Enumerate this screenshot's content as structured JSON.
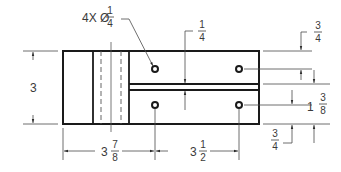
{
  "drawing": {
    "type": "orthographic-view",
    "line_color": "#1a1a1a",
    "dim_color": "#4a4a4a",
    "hole_callout": {
      "prefix": "4X Ø",
      "num": "1",
      "den": "4"
    },
    "dims": {
      "height": {
        "value": "3"
      },
      "slot_top": {
        "num": "1",
        "den": "4"
      },
      "top_offset": {
        "num": "3",
        "den": "4"
      },
      "hole_spacing_v": {
        "whole": "1",
        "num": "3",
        "den": "8"
      },
      "bottom_offset": {
        "num": "3",
        "den": "4"
      },
      "left_to_hole": {
        "whole": "3",
        "num": "7",
        "den": "8"
      },
      "hole_spacing_h": {
        "whole": "3",
        "num": "1",
        "den": "2"
      }
    }
  }
}
